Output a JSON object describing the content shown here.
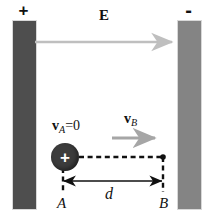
{
  "figure": {
    "width": 211,
    "height": 223
  },
  "plates": {
    "left": {
      "name": "positive-plate",
      "polarity_label": "+",
      "color": "#4e4e4e"
    },
    "right": {
      "name": "negative-plate",
      "polarity_label": "-",
      "color": "#848484"
    }
  },
  "field": {
    "label": "E",
    "arrow_color": "#bfbfbf",
    "direction": "left-to-right"
  },
  "charge": {
    "sign_label": "+",
    "color": "#3c3c3c",
    "sign_color": "#ffffff"
  },
  "velocities": {
    "initial": {
      "symbol": "v",
      "subscript": "A",
      "equals": "=0",
      "full_label": "vA=0"
    },
    "final": {
      "symbol": "v",
      "subscript": "B",
      "full_label": "vB",
      "arrow_color": "#a6a6a6"
    }
  },
  "points": {
    "start": "A",
    "end": "B"
  },
  "distance": {
    "label": "d",
    "line_color": "#111111"
  },
  "construction": {
    "dash_color": "#111111"
  }
}
